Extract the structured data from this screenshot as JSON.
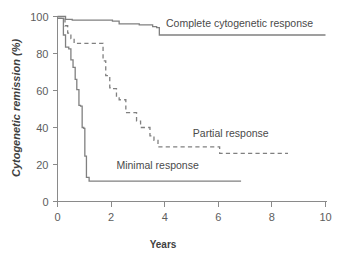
{
  "chart_data": {
    "type": "line",
    "title": "",
    "subtitle": "",
    "xlabel": "Years",
    "ylabel": "Cytogenetic remission (%)",
    "xlim": [
      0,
      10
    ],
    "ylim": [
      0,
      100
    ],
    "xticks": [
      0,
      2,
      4,
      6,
      8,
      10
    ],
    "xtick_labels": [
      "0",
      "2",
      "4",
      "6",
      "8",
      "10"
    ],
    "yticks": [
      0,
      20,
      40,
      60,
      80,
      100
    ],
    "ytick_labels": [
      "0",
      "20",
      "40",
      "60",
      "80",
      "100"
    ],
    "grid": false,
    "legend_position": "inline-annotations",
    "step_type": "post",
    "series": [
      {
        "name": "Complete cytogenetic response",
        "style": "solid",
        "color": "#808080",
        "label_text": "Complete cytogenetic response",
        "label_x": 4.05,
        "label_y": 96.5,
        "x": [
          0.0,
          0.18,
          0.3,
          0.55,
          1.55,
          2.05,
          2.3,
          3.05,
          3.55,
          3.7,
          3.8,
          10.0
        ],
        "y": [
          100.0,
          100.0,
          98.5,
          98.0,
          98.0,
          97.5,
          96.0,
          95.5,
          94.5,
          94.0,
          90.0,
          90.0
        ]
      },
      {
        "name": "Partial response",
        "style": "dashed",
        "color": "#808080",
        "label_text": "Partial response",
        "label_x": 5.05,
        "label_y": 37.0,
        "x": [
          0.0,
          0.22,
          0.28,
          0.38,
          0.5,
          0.62,
          1.55,
          1.7,
          1.8,
          1.95,
          2.05,
          2.2,
          2.3,
          2.55,
          2.8,
          2.95,
          3.1,
          3.25,
          3.45,
          3.6,
          3.75,
          5.9,
          6.05,
          8.6
        ],
        "y": [
          99.0,
          99.0,
          95.0,
          91.0,
          88.0,
          85.5,
          85.5,
          76.0,
          68.0,
          61.5,
          61.0,
          56.0,
          55.0,
          48.0,
          48.0,
          43.5,
          40.0,
          40.0,
          35.5,
          33.0,
          29.5,
          29.5,
          26.0,
          26.0
        ]
      },
      {
        "name": "Minimal response",
        "style": "solid",
        "color": "#808080",
        "label_text": "Minimal response",
        "label_x": 2.2,
        "label_y": 19.5,
        "x": [
          0.0,
          0.12,
          0.22,
          0.3,
          0.42,
          0.5,
          0.58,
          0.66,
          0.72,
          0.8,
          0.86,
          0.92,
          0.98,
          1.02,
          1.08,
          1.18,
          6.85
        ],
        "y": [
          99.0,
          99.0,
          90.0,
          83.5,
          82.5,
          76.5,
          72.5,
          66.0,
          60.5,
          52.0,
          51.5,
          40.0,
          39.5,
          24.5,
          13.0,
          11.0,
          11.0
        ]
      }
    ]
  },
  "axis": {
    "x_title": "Years",
    "y_title": "Cytogenetic remission (%)"
  }
}
